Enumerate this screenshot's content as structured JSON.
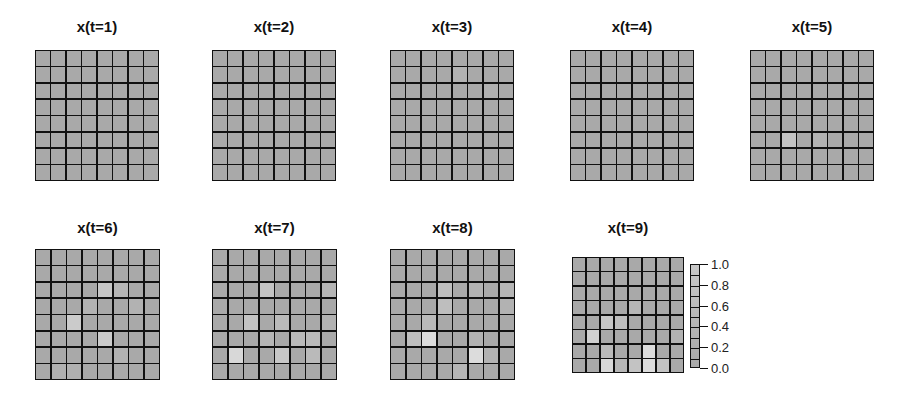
{
  "chart_data": {
    "type": "heatmap",
    "title": "",
    "grid_size": [
      8,
      8
    ],
    "colormap": "gray-to-white",
    "value_range": [
      0.0,
      1.0
    ],
    "colorbar": {
      "ticks": [
        1.0,
        0.8,
        0.6,
        0.4,
        0.2,
        0.0
      ],
      "tick_labels": [
        "1.0",
        "0.8",
        "0.6",
        "0.4",
        "0.2",
        "0.0"
      ],
      "position": "right of x(t=9)"
    },
    "panels": [
      {
        "title": "x(t=1)",
        "values": [
          [
            0,
            0,
            0,
            0,
            0,
            0,
            0,
            0
          ],
          [
            0,
            0,
            0,
            0,
            0,
            0,
            0,
            0
          ],
          [
            0,
            0,
            0,
            0,
            0,
            0,
            0,
            0
          ],
          [
            0,
            0,
            0,
            0,
            0,
            0,
            0,
            0
          ],
          [
            0,
            0,
            0,
            0,
            0,
            0,
            0,
            0
          ],
          [
            0,
            0,
            0,
            0,
            0,
            0,
            0,
            0
          ],
          [
            0,
            0,
            0,
            0,
            0,
            0,
            0,
            0
          ],
          [
            0,
            0,
            0,
            0,
            0,
            0,
            0,
            0
          ]
        ]
      },
      {
        "title": "x(t=2)",
        "values": [
          [
            0,
            0,
            0,
            0,
            0,
            0,
            0,
            0
          ],
          [
            0,
            0,
            0,
            0,
            0,
            0,
            0,
            0
          ],
          [
            0,
            0,
            0,
            0,
            0,
            0,
            0,
            0
          ],
          [
            0,
            0,
            0,
            0,
            0,
            0,
            0,
            0
          ],
          [
            0,
            0,
            0,
            0,
            0,
            0,
            0,
            0
          ],
          [
            0,
            0,
            0,
            0,
            0,
            0,
            0,
            0
          ],
          [
            0,
            0,
            0,
            0,
            0,
            0,
            0,
            0
          ],
          [
            0,
            0,
            0,
            0,
            0,
            0,
            0,
            0
          ]
        ]
      },
      {
        "title": "x(t=3)",
        "values": [
          [
            0,
            0,
            0,
            0,
            0,
            0,
            0,
            0
          ],
          [
            0,
            0,
            0,
            0,
            0.1,
            0,
            0,
            0
          ],
          [
            0,
            0,
            0,
            0,
            0,
            0,
            0.08,
            0
          ],
          [
            0,
            0,
            0,
            0,
            0,
            0,
            0,
            0
          ],
          [
            0,
            0,
            0,
            0,
            0,
            0,
            0,
            0
          ],
          [
            0,
            0,
            0,
            0,
            0,
            0,
            0,
            0
          ],
          [
            0,
            0,
            0,
            0,
            0,
            0,
            0,
            0
          ],
          [
            0,
            0,
            0,
            0,
            0,
            0,
            0,
            0
          ]
        ]
      },
      {
        "title": "x(t=4)",
        "values": [
          [
            0,
            0,
            0,
            0,
            0,
            0,
            0,
            0
          ],
          [
            0,
            0,
            0,
            0,
            0,
            0,
            0,
            0
          ],
          [
            0,
            0,
            0,
            0,
            0,
            0,
            0,
            0
          ],
          [
            0,
            0,
            0,
            0,
            0,
            0,
            0,
            0
          ],
          [
            0,
            0,
            0,
            0,
            0,
            0,
            0,
            0
          ],
          [
            0,
            0,
            0,
            0,
            0,
            0,
            0,
            0
          ],
          [
            0,
            0,
            0,
            0,
            0,
            0,
            0,
            0
          ],
          [
            0,
            0,
            0,
            0,
            0,
            0,
            0,
            0
          ]
        ]
      },
      {
        "title": "x(t=5)",
        "values": [
          [
            0,
            0,
            0,
            0,
            0,
            0,
            0,
            0
          ],
          [
            0,
            0,
            0,
            0,
            0,
            0,
            0,
            0
          ],
          [
            0,
            0,
            0,
            0,
            0,
            0,
            0,
            0
          ],
          [
            0,
            0,
            0,
            0,
            0,
            0,
            0,
            0
          ],
          [
            0,
            0,
            0,
            0,
            0,
            0,
            0,
            0
          ],
          [
            0,
            0,
            0.3,
            0,
            0.1,
            0,
            0,
            0
          ],
          [
            0,
            0,
            0,
            0,
            0,
            0,
            0,
            0
          ],
          [
            0,
            0,
            0,
            0,
            0,
            0,
            0,
            0
          ]
        ]
      },
      {
        "title": "x(t=6)",
        "values": [
          [
            0,
            0,
            0,
            0,
            0,
            0,
            0,
            0
          ],
          [
            0,
            0,
            0,
            0,
            0,
            0,
            0,
            0
          ],
          [
            0,
            0,
            0,
            0,
            0.35,
            0.15,
            0,
            0
          ],
          [
            0,
            0,
            0,
            0.12,
            0,
            0,
            0.1,
            0
          ],
          [
            0,
            0,
            0.4,
            0,
            0,
            0,
            0,
            0
          ],
          [
            0,
            0,
            0,
            0,
            0.4,
            0,
            0,
            0
          ],
          [
            0,
            0,
            0,
            0,
            0,
            0.1,
            0,
            0
          ],
          [
            0,
            0.08,
            0.08,
            0,
            0,
            0,
            0,
            0
          ]
        ]
      },
      {
        "title": "x(t=7)",
        "values": [
          [
            0,
            0,
            0,
            0,
            0,
            0,
            0,
            0
          ],
          [
            0,
            0,
            0,
            0,
            0,
            0,
            0,
            0
          ],
          [
            0,
            0,
            0,
            0.3,
            0,
            0,
            0,
            0.15
          ],
          [
            0,
            0,
            0,
            0,
            0,
            0,
            0,
            0
          ],
          [
            0,
            0,
            0.3,
            0,
            0.2,
            0,
            0,
            0.1
          ],
          [
            0,
            0,
            0,
            0.15,
            0,
            0.2,
            0.2,
            0
          ],
          [
            0,
            0.55,
            0,
            0,
            0.35,
            0,
            0.2,
            0
          ],
          [
            0,
            0,
            0,
            0,
            0,
            0,
            0,
            0
          ]
        ]
      },
      {
        "title": "x(t=8)",
        "values": [
          [
            0,
            0,
            0,
            0,
            0,
            0,
            0,
            0
          ],
          [
            0,
            0,
            0,
            0,
            0,
            0,
            0,
            0
          ],
          [
            0,
            0,
            0,
            0.25,
            0,
            0.1,
            0,
            0.15
          ],
          [
            0,
            0,
            0,
            0.25,
            0,
            0,
            0,
            0.1
          ],
          [
            0,
            0,
            0.2,
            0,
            0,
            0,
            0,
            0
          ],
          [
            0,
            0.25,
            0.6,
            0,
            0,
            0.1,
            0,
            0
          ],
          [
            0,
            0,
            0,
            0,
            0,
            0.6,
            0.1,
            0
          ],
          [
            0,
            0,
            0,
            0,
            0.15,
            0,
            0,
            0
          ]
        ]
      },
      {
        "title": "x(t=9)",
        "values": [
          [
            0,
            0,
            0,
            0,
            0,
            0,
            0,
            0
          ],
          [
            0,
            0,
            0,
            0,
            0,
            0,
            0,
            0
          ],
          [
            0,
            0,
            0,
            0,
            0,
            0,
            0,
            0
          ],
          [
            0,
            0,
            0,
            0,
            0.15,
            0,
            0,
            0
          ],
          [
            0,
            0,
            0.35,
            0.25,
            0,
            0,
            0,
            0
          ],
          [
            0,
            0.45,
            0,
            0,
            0,
            0,
            0,
            0.1
          ],
          [
            0,
            0,
            0.2,
            0,
            0,
            0.6,
            0,
            0
          ],
          [
            0,
            0,
            0.55,
            0.15,
            0.3,
            0.6,
            0.3,
            0
          ]
        ]
      }
    ]
  },
  "panels": [
    {
      "title": "x(t=1)"
    },
    {
      "title": "x(t=2)"
    },
    {
      "title": "x(t=3)"
    },
    {
      "title": "x(t=4)"
    },
    {
      "title": "x(t=5)"
    },
    {
      "title": "x(t=6)"
    },
    {
      "title": "x(t=7)"
    },
    {
      "title": "x(t=8)"
    },
    {
      "title": "x(t=9)"
    }
  ],
  "colorbar": {
    "labels": [
      "1.0",
      "0.8",
      "0.6",
      "0.4",
      "0.2",
      "0.0"
    ]
  }
}
